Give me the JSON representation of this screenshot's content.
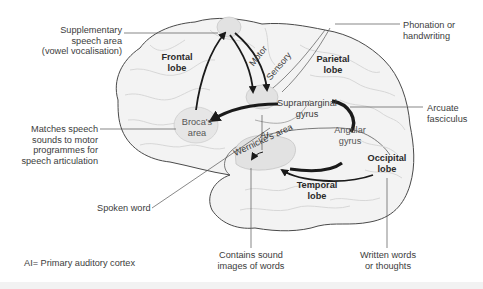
{
  "diagram": {
    "colors": {
      "background": "#ffffff",
      "brain_fill": "#f3f3f3",
      "brain_outline": "#4a4a4a",
      "gyri_lines": "#d4d4d4",
      "area_fill": "#e2e2e2",
      "arrow": "#1a1a1a",
      "leader_line": "#555555",
      "text": "#3c3c3c"
    },
    "lobes": {
      "frontal": [
        "Frontal",
        "lobe"
      ],
      "parietal": [
        "Parietal",
        "lobe"
      ],
      "temporal": [
        "Temporal",
        "lobe"
      ],
      "occipital": [
        "Occipital",
        "lobe"
      ]
    },
    "areas": {
      "broca": [
        "Broca's",
        "area"
      ],
      "supramarginal": [
        "Supramarginal",
        "gyrus"
      ],
      "angular": [
        "Angular",
        "gyrus"
      ],
      "wernicke": "Wernicke's area",
      "ai": "AI",
      "motor": "Motor",
      "sensory": "Sensory"
    },
    "callouts": {
      "supplementary": [
        "Supplementary",
        "speech area",
        "(vowel vocalisation)"
      ],
      "phonation": [
        "Phonation or",
        "handwriting"
      ],
      "matches": [
        "Matches speech",
        "sounds to motor",
        "programmes for",
        "speech articulation"
      ],
      "arcuate": [
        "Arcuate",
        "fasciculus"
      ],
      "spoken": "Spoken word",
      "contains": [
        "Contains sound",
        "images of words"
      ],
      "written": [
        "Written words",
        "or thoughts"
      ]
    },
    "legend": "AI= Primary auditory cortex"
  }
}
